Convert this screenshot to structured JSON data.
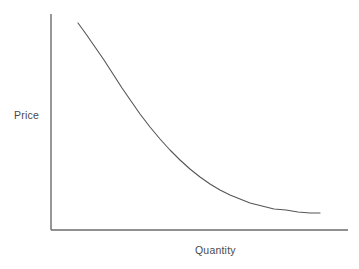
{
  "figure": {
    "background_color": "#ffffff",
    "line_color": "#555555",
    "axis_color": "#6b6b6b",
    "label_color": "#4a4a4a"
  },
  "chart_data": {
    "type": "line",
    "title": "",
    "subtitle": "",
    "xlabel": "Quantity",
    "ylabel": "Price",
    "grid": false,
    "legend": false,
    "legend_position": "none",
    "axis_ticks": false,
    "tick_labels_x": [],
    "tick_labels_y": [],
    "xlim": [
      0,
      1
    ],
    "ylim": [
      0,
      1
    ],
    "annotations": [],
    "series": [
      {
        "name": "Demand curve",
        "shape": "convex-decreasing",
        "points_px": [
          [
            78,
            23
          ],
          [
            86,
            34
          ],
          [
            95,
            47
          ],
          [
            104,
            60
          ],
          [
            113,
            74
          ],
          [
            122,
            88
          ],
          [
            131,
            101
          ],
          [
            140,
            114
          ],
          [
            150,
            127
          ],
          [
            160,
            139
          ],
          [
            170,
            150
          ],
          [
            180,
            160
          ],
          [
            190,
            169
          ],
          [
            200,
            177
          ],
          [
            210,
            184
          ],
          [
            220,
            190
          ],
          [
            230,
            195
          ],
          [
            240,
            199
          ],
          [
            250,
            203
          ],
          [
            262,
            206
          ],
          [
            274,
            209
          ],
          [
            286,
            210
          ],
          [
            298,
            212
          ],
          [
            310,
            213
          ],
          [
            320,
            213
          ]
        ],
        "x_normalized": [
          0.09,
          0.12,
          0.15,
          0.18,
          0.21,
          0.24,
          0.27,
          0.3,
          0.33,
          0.37,
          0.4,
          0.43,
          0.47,
          0.5,
          0.54,
          0.57,
          0.6,
          0.64,
          0.67,
          0.71,
          0.75,
          0.79,
          0.83,
          0.87,
          0.91
        ],
        "y_normalized": [
          0.96,
          0.91,
          0.85,
          0.79,
          0.72,
          0.66,
          0.6,
          0.54,
          0.48,
          0.42,
          0.37,
          0.32,
          0.28,
          0.25,
          0.21,
          0.19,
          0.16,
          0.14,
          0.13,
          0.11,
          0.1,
          0.09,
          0.08,
          0.08,
          0.08
        ]
      }
    ],
    "axes_px": {
      "y_axis": {
        "x": 51,
        "y_top": 14,
        "y_bottom": 230
      },
      "x_axis": {
        "y": 230,
        "x_left": 51,
        "x_right": 348
      }
    }
  },
  "labels": {
    "y_axis": "Price",
    "x_axis": "Quantity"
  }
}
